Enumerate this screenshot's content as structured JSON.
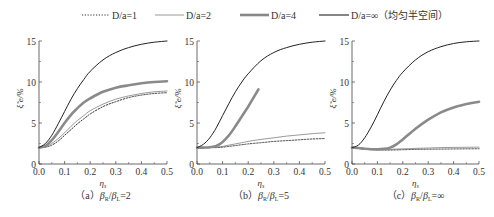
{
  "legend": [
    {
      "label": "D/a=1",
      "style": "dotted",
      "color": "#333333",
      "width": 1.0
    },
    {
      "label": "D/a=2",
      "style": "thin",
      "color": "#555555",
      "width": 0.6
    },
    {
      "label": "D/a=4",
      "style": "thick",
      "color": "#888888",
      "width": 2.6
    },
    {
      "label": "D/a=∞（均匀半空间）",
      "style": "solid",
      "color": "#222222",
      "width": 1.1
    }
  ],
  "chart_data": [
    {
      "type": "line",
      "caption": "（a）β_R/β_L=2",
      "caption_parts": {
        "prefix": "（a）",
        "expr": "βR/βL=2"
      },
      "xlabel": "η_s",
      "ylabel": "ξ̃_e/%",
      "xlim": [
        0,
        0.5
      ],
      "ylim": [
        0,
        15
      ],
      "xticks": [
        "0.0",
        "0.1",
        "0.2",
        "0.3",
        "0.4",
        "0.5"
      ],
      "yticks": [
        "0",
        "5",
        "10",
        "15"
      ],
      "x": [
        0,
        0.025,
        0.05,
        0.075,
        0.1,
        0.125,
        0.15,
        0.175,
        0.2,
        0.25,
        0.3,
        0.35,
        0.4,
        0.45,
        0.5
      ],
      "series": [
        {
          "name": "D/a=1",
          "values": [
            2.0,
            2.05,
            2.3,
            2.8,
            3.5,
            4.2,
            4.9,
            5.5,
            6.1,
            7.0,
            7.6,
            8.1,
            8.4,
            8.6,
            8.7
          ]
        },
        {
          "name": "D/a=2",
          "values": [
            2.0,
            2.1,
            2.5,
            3.1,
            3.8,
            4.6,
            5.3,
            5.9,
            6.5,
            7.3,
            7.9,
            8.3,
            8.6,
            8.8,
            8.9
          ]
        },
        {
          "name": "D/a=4",
          "values": [
            2.0,
            2.2,
            2.9,
            3.9,
            5.0,
            6.0,
            6.8,
            7.5,
            8.0,
            8.8,
            9.3,
            9.6,
            9.85,
            10.0,
            10.1
          ]
        },
        {
          "name": "D/a=∞",
          "values": [
            2.0,
            2.5,
            3.5,
            4.9,
            6.4,
            7.9,
            9.2,
            10.3,
            11.3,
            12.7,
            13.6,
            14.2,
            14.6,
            14.85,
            15.0
          ]
        }
      ]
    },
    {
      "type": "line",
      "caption": "（b）β_R/β_L=5",
      "caption_parts": {
        "prefix": "（b）",
        "expr": "βR/βL=5"
      },
      "xlabel": "η_s",
      "ylabel": "ξ̃_e/%",
      "xlim": [
        0,
        0.5
      ],
      "ylim": [
        0,
        15
      ],
      "xticks": [
        "0.0",
        "0.1",
        "0.2",
        "0.3",
        "0.4",
        "0.5"
      ],
      "yticks": [
        "0",
        "5",
        "10",
        "15"
      ],
      "x": [
        0,
        0.025,
        0.05,
        0.075,
        0.1,
        0.125,
        0.15,
        0.175,
        0.2,
        0.25,
        0.3,
        0.35,
        0.4,
        0.45,
        0.5
      ],
      "series": [
        {
          "name": "D/a=1",
          "values": [
            2.0,
            2.0,
            2.0,
            2.0,
            2.05,
            2.15,
            2.25,
            2.35,
            2.45,
            2.6,
            2.75,
            2.85,
            2.95,
            3.05,
            3.1
          ]
        },
        {
          "name": "D/a=2",
          "values": [
            2.0,
            2.0,
            2.0,
            2.05,
            2.15,
            2.3,
            2.45,
            2.6,
            2.75,
            3.0,
            3.2,
            3.4,
            3.55,
            3.7,
            3.8
          ]
        },
        {
          "name": "D/a=4",
          "x": [
            0,
            0.025,
            0.05,
            0.075,
            0.1,
            0.125,
            0.15,
            0.175,
            0.2,
            0.225,
            0.24
          ],
          "values": [
            2.0,
            2.0,
            2.05,
            2.2,
            2.7,
            3.5,
            4.6,
            5.8,
            7.0,
            8.3,
            9.1
          ]
        },
        {
          "name": "D/a=∞",
          "values": [
            2.0,
            2.4,
            3.2,
            4.4,
            5.9,
            7.4,
            8.8,
            10.0,
            11.0,
            12.6,
            13.6,
            14.2,
            14.6,
            14.85,
            15.0
          ]
        }
      ]
    },
    {
      "type": "line",
      "caption": "（c）β_R/β_L=∞",
      "caption_parts": {
        "prefix": "（c）",
        "expr": "βR/βL=∞"
      },
      "xlabel": "η_s",
      "ylabel": "ξ̃_e/%",
      "xlim": [
        0,
        0.5
      ],
      "ylim": [
        0,
        15
      ],
      "xticks": [
        "0.0",
        "0.1",
        "0.2",
        "0.3",
        "0.4",
        "0.5"
      ],
      "yticks": [
        "0",
        "5",
        "10",
        "15"
      ],
      "x": [
        0,
        0.025,
        0.05,
        0.075,
        0.1,
        0.125,
        0.15,
        0.175,
        0.2,
        0.25,
        0.3,
        0.35,
        0.4,
        0.45,
        0.5
      ],
      "series": [
        {
          "name": "D/a=1",
          "values": [
            2.0,
            1.9,
            1.8,
            1.75,
            1.7,
            1.7,
            1.7,
            1.72,
            1.74,
            1.78,
            1.8,
            1.82,
            1.84,
            1.85,
            1.86
          ]
        },
        {
          "name": "D/a=2",
          "values": [
            2.0,
            1.95,
            1.85,
            1.8,
            1.78,
            1.78,
            1.8,
            1.82,
            1.85,
            1.9,
            1.95,
            2.0,
            2.02,
            2.04,
            2.05
          ]
        },
        {
          "name": "D/a=4",
          "values": [
            2.0,
            1.95,
            1.85,
            1.8,
            1.8,
            1.85,
            2.0,
            2.4,
            3.0,
            4.3,
            5.4,
            6.3,
            6.9,
            7.3,
            7.6
          ]
        },
        {
          "name": "D/a=∞",
          "values": [
            2.0,
            2.3,
            3.2,
            4.5,
            6.0,
            7.6,
            9.0,
            10.2,
            11.2,
            12.7,
            13.7,
            14.3,
            14.7,
            14.9,
            15.0
          ]
        }
      ]
    }
  ]
}
